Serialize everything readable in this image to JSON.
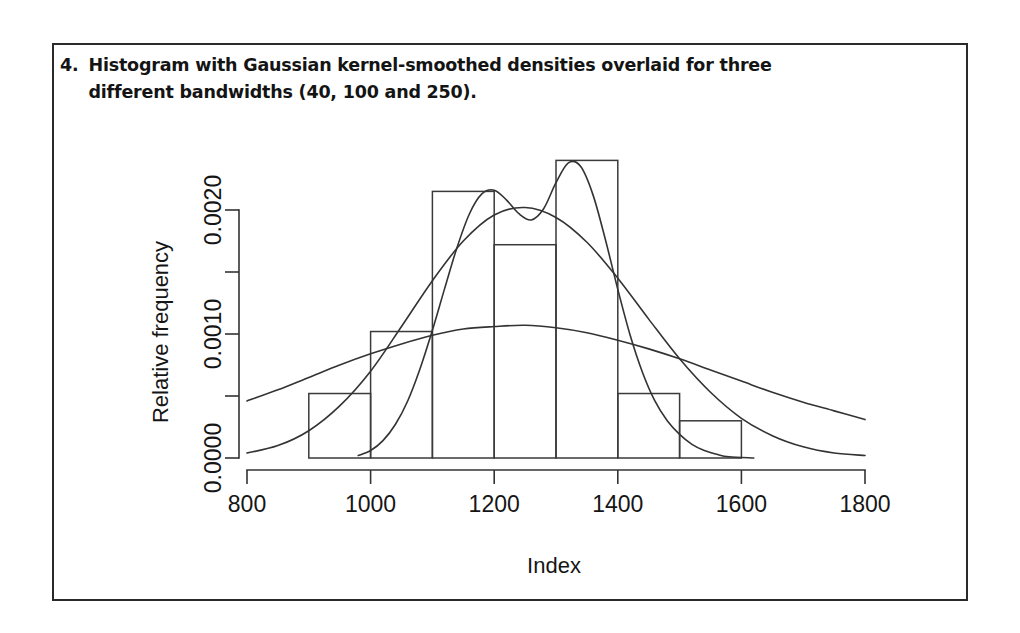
{
  "caption": {
    "number": "4.",
    "text": "Histogram with Gaussian kernel-smoothed densities overlaid for three different bandwidths (40, 100 and 250)."
  },
  "chart_data": {
    "type": "bar",
    "title": "",
    "xlabel": "Index",
    "ylabel": "Relative frequency",
    "xlim": [
      800,
      1800
    ],
    "ylim": [
      0.0,
      0.00225
    ],
    "grid": false,
    "legend": "none",
    "x_ticks": [
      800,
      1000,
      1200,
      1400,
      1600,
      1800
    ],
    "x_tick_labels": [
      "800",
      "1000",
      "1200",
      "1400",
      "1600",
      "1800"
    ],
    "y_ticks": [
      0.0,
      0.0005,
      0.001,
      0.0015,
      0.002
    ],
    "y_tick_labels": [
      "0.0000",
      "",
      "0.0010",
      "",
      "0.0020"
    ],
    "histogram": {
      "bin_edges": [
        900,
        1000,
        1100,
        1200,
        1300,
        1400,
        1500,
        1600
      ],
      "bin_labels": [
        "900-1000",
        "1000-1100",
        "1100-1200",
        "1200-1300",
        "1300-1400",
        "1400-1500",
        "1500-1600"
      ],
      "values": [
        0.00052,
        0.00102,
        0.00215,
        0.00172,
        0.0024,
        0.00052,
        0.0003
      ]
    },
    "series": [
      {
        "name": "Gaussian kernel density, bandwidth 40",
        "bandwidth": 40,
        "x": [
          980,
          1000,
          1020,
          1040,
          1060,
          1080,
          1100,
          1120,
          1140,
          1160,
          1180,
          1200,
          1220,
          1240,
          1260,
          1280,
          1300,
          1320,
          1340,
          1360,
          1380,
          1400,
          1420,
          1440,
          1460,
          1480,
          1500,
          1520,
          1540,
          1560,
          1580,
          1620
        ],
        "values": [
          2e-05,
          6e-05,
          0.00014,
          0.00027,
          0.00046,
          0.00072,
          0.00103,
          0.00137,
          0.0017,
          0.00197,
          0.00213,
          0.00216,
          0.00208,
          0.00197,
          0.00192,
          0.00201,
          0.00222,
          0.00238,
          0.00235,
          0.00212,
          0.00176,
          0.00136,
          0.00099,
          0.00069,
          0.00046,
          0.0003,
          0.00019,
          0.00011,
          6e-05,
          3e-05,
          1e-05,
          0.0
        ]
      },
      {
        "name": "Gaussian kernel density, bandwidth 100",
        "bandwidth": 100,
        "x": [
          800,
          850,
          900,
          950,
          1000,
          1050,
          1100,
          1150,
          1200,
          1250,
          1300,
          1350,
          1400,
          1450,
          1500,
          1550,
          1600,
          1650,
          1700,
          1750,
          1800
        ],
        "values": [
          4e-05,
          0.0001,
          0.00022,
          0.00042,
          0.0007,
          0.00106,
          0.00143,
          0.00175,
          0.00196,
          0.00202,
          0.00194,
          0.00174,
          0.00145,
          0.00112,
          0.0008,
          0.00053,
          0.00032,
          0.00018,
          9e-05,
          4e-05,
          2e-05
        ]
      },
      {
        "name": "Gaussian kernel density, bandwidth 250",
        "bandwidth": 250,
        "x": [
          800,
          850,
          900,
          950,
          1000,
          1050,
          1100,
          1150,
          1200,
          1250,
          1300,
          1350,
          1400,
          1450,
          1500,
          1550,
          1600,
          1650,
          1700,
          1750,
          1800
        ],
        "values": [
          0.00046,
          0.00055,
          0.00065,
          0.00075,
          0.00084,
          0.00092,
          0.00099,
          0.00104,
          0.00106,
          0.00107,
          0.00105,
          0.00101,
          0.00095,
          0.00088,
          0.0008,
          0.00071,
          0.00062,
          0.00053,
          0.00045,
          0.00038,
          0.00031
        ]
      }
    ]
  }
}
